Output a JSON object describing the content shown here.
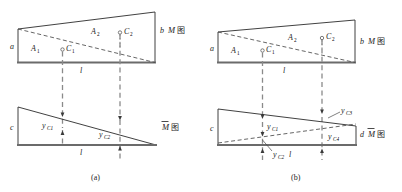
{
  "figure": {
    "title_note": "Graph multiplication method: M diagram and unit M-bar diagram",
    "colors": {
      "outline": "#2b2b2b",
      "baseline": "#6b6b6b",
      "dashed": "#4a4a4a",
      "projection": "#8a8a8a",
      "text": "#1d1d1d",
      "background": "#ffffff"
    },
    "panels": [
      {
        "id": "a",
        "caption": "(a)",
        "upper_diagram": {
          "name": "M-diagram",
          "diagram_label": "M",
          "diagram_label_cjk": "图",
          "ordinate_left": "a",
          "ordinate_right": "b",
          "span_label": "l",
          "areas": [
            {
              "label": "A",
              "sub": "1"
            },
            {
              "label": "A",
              "sub": "2"
            }
          ],
          "centroids": [
            {
              "label": "C",
              "sub": "1"
            },
            {
              "label": "C",
              "sub": "2"
            }
          ]
        },
        "lower_diagram": {
          "name": "M-bar-diagram",
          "diagram_label": "M",
          "diagram_label_overbar": true,
          "diagram_label_cjk": "图",
          "ordinate_left": "c",
          "span_label": "l",
          "ordinates": [
            {
              "label": "y",
              "sub": "C1"
            },
            {
              "label": "y",
              "sub": "C2"
            }
          ]
        }
      },
      {
        "id": "b",
        "caption": "(b)",
        "upper_diagram": {
          "name": "M-diagram",
          "diagram_label": "M",
          "diagram_label_cjk": "图",
          "ordinate_left": "a",
          "ordinate_right": "b",
          "span_label": "l",
          "areas": [
            {
              "label": "A",
              "sub": "1"
            },
            {
              "label": "A",
              "sub": "2"
            }
          ],
          "centroids": [
            {
              "label": "C",
              "sub": "1"
            },
            {
              "label": "C",
              "sub": "2"
            }
          ]
        },
        "lower_diagram": {
          "name": "M-bar-diagram",
          "diagram_label": "M",
          "diagram_label_overbar": true,
          "diagram_label_cjk": "图",
          "ordinate_left": "c",
          "ordinate_right": "d",
          "span_label": "l",
          "ordinates": [
            {
              "label": "y",
              "sub": "C1"
            },
            {
              "label": "y",
              "sub": "C2"
            },
            {
              "label": "y",
              "sub": "C3"
            },
            {
              "label": "y",
              "sub": "C4"
            }
          ]
        }
      }
    ]
  }
}
